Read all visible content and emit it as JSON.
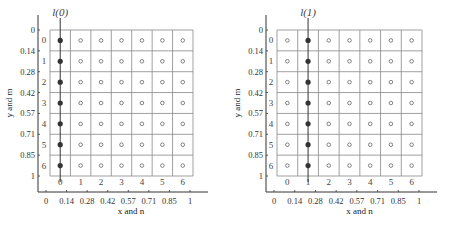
{
  "panels": [
    {
      "title": "l(0)",
      "highlight_column": 0,
      "xlabel": "x and n",
      "ylabel": "y and m",
      "x_ticks": [
        "0",
        "0.14",
        "0.28",
        "0.42",
        "0.57",
        "0.71",
        "0.85",
        "1"
      ],
      "y_ticks": [
        "0",
        "0.14",
        "0.28",
        "0.42",
        "0.57",
        "0.71",
        "0.85",
        "1"
      ],
      "col_indices": [
        "0",
        "1",
        "2",
        "3",
        "4",
        "5",
        "6"
      ],
      "row_indices": [
        "0",
        "1",
        "2",
        "3",
        "4",
        "5",
        "6"
      ]
    },
    {
      "title": "l(1)",
      "highlight_column": 1,
      "xlabel": "x and n",
      "ylabel": "y and m",
      "x_ticks": [
        "0",
        "0.14",
        "0.28",
        "0.42",
        "0.57",
        "0.71",
        "0.85",
        "1"
      ],
      "y_ticks": [
        "0",
        "0.14",
        "0.28",
        "0.42",
        "0.57",
        "0.71",
        "0.85",
        "1"
      ],
      "col_indices": [
        "0",
        "1",
        "2",
        "3",
        "4",
        "5",
        "6"
      ],
      "row_indices": [
        "0",
        "1",
        "2",
        "3",
        "4",
        "5",
        "6"
      ]
    }
  ],
  "grid": {
    "rows": 7,
    "cols": 7
  },
  "colors": {
    "filled_point": "#333333",
    "open_point": "#666666",
    "grid_line": "#888888",
    "axis": "#333333"
  }
}
